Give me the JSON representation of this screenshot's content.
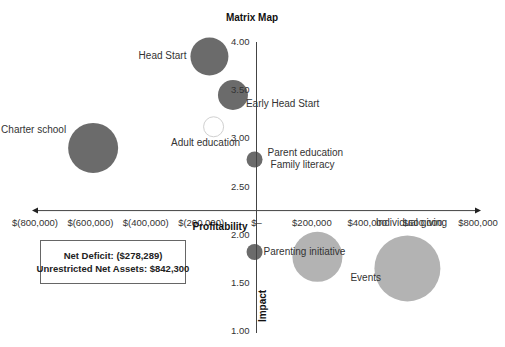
{
  "chart_data": {
    "type": "scatter",
    "subtype": "bubble",
    "title": "Matrix Map",
    "xlabel": "Profitability",
    "ylabel": "Impact",
    "xlim": [
      -800000,
      800000
    ],
    "ylim": [
      1.0,
      4.0
    ],
    "x_axis_crosses_y_at": 2.25,
    "y_axis_crosses_x_at": 0,
    "grid": false,
    "x_ticks": [
      -800000,
      -600000,
      -400000,
      -200000,
      0,
      200000,
      400000,
      600000,
      800000
    ],
    "x_tick_labels": [
      "$(800,000)",
      "$(600,000)",
      "$(400,000)",
      "$(200,000)",
      "$–",
      "$200,000",
      "$400,000",
      "$600,000",
      "$800,000"
    ],
    "y_ticks": [
      1.0,
      1.5,
      2.0,
      2.5,
      3.0,
      3.5,
      4.0
    ],
    "y_tick_labels": [
      "1.00",
      "1.50",
      "2.00",
      "2.50",
      "3.00",
      "3.50",
      "4.00"
    ],
    "series": [
      {
        "name": "Programs",
        "color": "#6b6b6b",
        "points": [
          {
            "label": "Head Start",
            "x": -170000,
            "y": 3.85,
            "size": 19,
            "label_pos": "left"
          },
          {
            "label": "Early Head Start",
            "x": -85000,
            "y": 3.45,
            "size": 15,
            "label_pos": "below-right"
          },
          {
            "label": "Adult education",
            "x": -155000,
            "y": 3.12,
            "size": 10,
            "label_pos": "below",
            "hollow": true
          },
          {
            "label": "Charter school",
            "x": -590000,
            "y": 2.9,
            "size": 25,
            "label_pos": "upper-left"
          },
          {
            "label": "Parent education\nFamily literacy",
            "x": -7000,
            "y": 2.78,
            "size": 8,
            "label_pos": "right"
          },
          {
            "label": "Parenting initiative",
            "x": -7000,
            "y": 1.82,
            "size": 8,
            "label_pos": "right"
          }
        ]
      },
      {
        "name": "Fundraising",
        "color": "#b3b3b3",
        "points": [
          {
            "label": "Events",
            "x": 220000,
            "y": 1.77,
            "size": 25,
            "label_pos": "lower-right"
          },
          {
            "label": "Individual giving",
            "x": 545000,
            "y": 1.65,
            "size": 33,
            "label_pos": "above"
          }
        ]
      }
    ]
  },
  "summary": {
    "net_deficit": "Net Deficit: ($278,289)",
    "unrestricted_net_assets": "Unrestricted Net Assets: $842,300"
  }
}
